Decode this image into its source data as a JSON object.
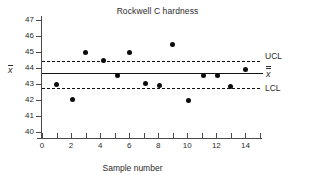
{
  "chart_data": {
    "type": "scatter",
    "title": "Rockwell C hardness",
    "xlabel": "Sample number",
    "ylabel": "x̄",
    "ylabel_plain": "x-bar",
    "xlim": [
      0,
      15
    ],
    "ylim": [
      39.6,
      47.4
    ],
    "yticks": [
      47,
      46,
      45,
      44,
      43,
      42,
      41,
      40
    ],
    "ytick_labels": [
      "47",
      "46",
      "45",
      "44",
      "43",
      "42",
      "41",
      "40"
    ],
    "xticks": [
      0,
      1,
      2,
      3,
      4,
      5,
      6,
      7,
      8,
      9,
      10,
      11,
      12,
      13,
      14,
      15
    ],
    "xtick_labels_shown": [
      "0",
      "2",
      "4",
      "6",
      "8",
      "10",
      "12",
      "14"
    ],
    "xtick_labels_values": [
      0,
      2,
      4,
      6,
      8,
      10,
      12,
      14
    ],
    "grid": false,
    "legend_position": "right-inline",
    "x": [
      1,
      2.1,
      3,
      4.2,
      5.2,
      6,
      7.1,
      8.1,
      9,
      10.1,
      11.1,
      12.1,
      13,
      14
    ],
    "values": [
      42.95,
      42.05,
      45.0,
      44.45,
      43.55,
      45.0,
      43.05,
      42.9,
      45.45,
      42.0,
      43.55,
      43.55,
      42.85,
      43.9
    ],
    "series": [
      {
        "name": "x-bar subgroup means",
        "x": [
          1,
          2.1,
          3,
          4.2,
          5.2,
          6,
          7.1,
          8.1,
          9,
          10.1,
          11.1,
          12.1,
          13,
          14
        ],
        "values": [
          42.95,
          42.05,
          45.0,
          44.45,
          43.55,
          45.0,
          43.05,
          42.9,
          45.45,
          42.0,
          43.55,
          43.55,
          42.85,
          43.9
        ]
      }
    ],
    "reference_lines": [
      {
        "label": "UCL",
        "value": 44.45,
        "style": "dashed"
      },
      {
        "label": "x̄̄",
        "label_plain": "x-double-bar",
        "value": 43.7,
        "style": "solid"
      },
      {
        "label": "LCL",
        "value": 42.75,
        "style": "dashed"
      }
    ],
    "colors": {
      "marker": "#0b0b0b",
      "line": "#111111",
      "axis": "#4a4a4a",
      "text": "#2b2b2b",
      "background": "#ffffff"
    }
  },
  "labels": {
    "ucl": "UCL",
    "lcl": "LCL",
    "center": "x"
  }
}
